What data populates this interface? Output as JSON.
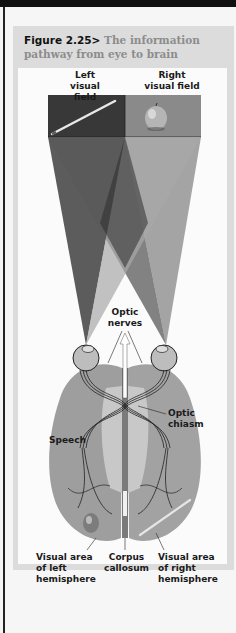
{
  "figure": {
    "number": "Figure 2.25>",
    "title_line1": "The information",
    "title_line2": "pathway from eye to brain"
  },
  "labels": {
    "left_field_1": "Left",
    "left_field_2": "visual field",
    "right_field_1": "Right",
    "right_field_2": "visual field",
    "optic_nerves_1": "Optic",
    "optic_nerves_2": "nerves",
    "optic_chiasm_1": "Optic",
    "optic_chiasm_2": "chiasm",
    "speech": "Speech",
    "visual_left_1": "Visual area",
    "visual_left_2": "of left",
    "visual_left_3": "hemisphere",
    "corpus_1": "Corpus",
    "corpus_2": "callosum",
    "visual_right_1": "Visual area",
    "visual_right_2": "of right",
    "visual_right_3": "hemisphere"
  },
  "colors": {
    "left_field": "#3a3a3a",
    "right_field": "#8a8a8a",
    "brain": "#9c9c9c",
    "title_gray": "#8c8c8c"
  }
}
